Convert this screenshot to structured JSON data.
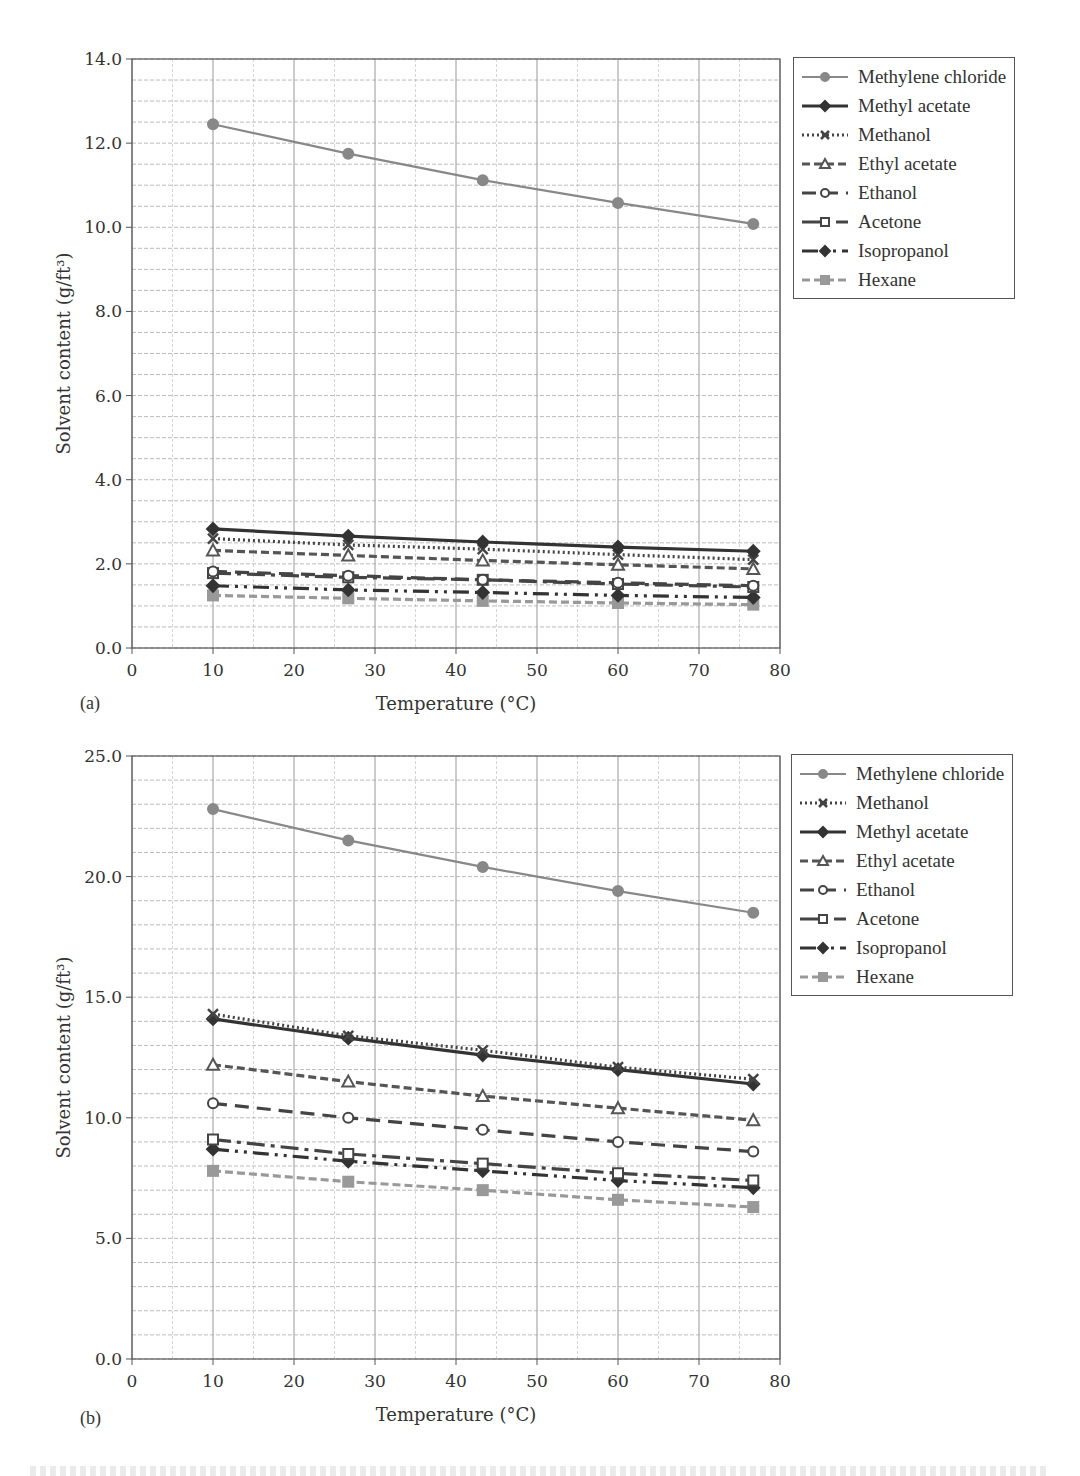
{
  "chart_data": [
    {
      "panel": "(a)",
      "type": "line",
      "title": "",
      "xlabel": "Temperature (°C)",
      "ylabel": "Solvent content (g/ft3)",
      "xlim": [
        0,
        80
      ],
      "ylim": [
        0,
        14
      ],
      "xticks": [
        0,
        10,
        20,
        30,
        40,
        50,
        60,
        70,
        80
      ],
      "yticks": [
        "0.0",
        "2.0",
        "4.0",
        "6.0",
        "8.0",
        "10.0",
        "12.0",
        "14.0"
      ],
      "grid": true,
      "legend_position": "right",
      "x": [
        10,
        26.7,
        43.3,
        60,
        76.7
      ],
      "series": [
        {
          "name": "Methylene chloride",
          "values": [
            12.45,
            11.75,
            11.12,
            10.58,
            10.08
          ],
          "style": "solid",
          "marker": "circle",
          "color": "#888888"
        },
        {
          "name": "Methyl acetate",
          "values": [
            2.83,
            2.66,
            2.52,
            2.4,
            2.3
          ],
          "style": "solid",
          "marker": "diamond",
          "color": "#333333"
        },
        {
          "name": "Methanol",
          "values": [
            2.6,
            2.45,
            2.35,
            2.22,
            2.1
          ],
          "style": "dotted",
          "marker": "x",
          "color": "#444444"
        },
        {
          "name": "Ethyl acetate",
          "values": [
            2.32,
            2.2,
            2.08,
            1.98,
            1.88
          ],
          "style": "dashed",
          "marker": "triangle",
          "color": "#555555"
        },
        {
          "name": "Ethanol",
          "values": [
            1.82,
            1.72,
            1.62,
            1.55,
            1.48
          ],
          "style": "longdash",
          "marker": "circle-open",
          "color": "#444444"
        },
        {
          "name": "Acetone",
          "values": [
            1.78,
            1.68,
            1.62,
            1.52,
            1.45
          ],
          "style": "dashdot",
          "marker": "square-open",
          "color": "#444444"
        },
        {
          "name": "Isopropanol",
          "values": [
            1.48,
            1.38,
            1.32,
            1.25,
            1.2
          ],
          "style": "dashdotdot",
          "marker": "diamond",
          "color": "#333333"
        },
        {
          "name": "Hexane",
          "values": [
            1.25,
            1.18,
            1.12,
            1.07,
            1.03
          ],
          "style": "dashed",
          "marker": "square",
          "color": "#999999"
        }
      ]
    },
    {
      "panel": "(b)",
      "type": "line",
      "title": "",
      "xlabel": "Temperature (°C)",
      "ylabel": "Solvent content (g/ft3)",
      "xlim": [
        0,
        80
      ],
      "ylim": [
        0,
        25
      ],
      "xticks": [
        0,
        10,
        20,
        30,
        40,
        50,
        60,
        70,
        80
      ],
      "yticks": [
        "0.0",
        "5.0",
        "10.0",
        "15.0",
        "20.0",
        "25.0"
      ],
      "grid": true,
      "legend_position": "right",
      "x": [
        10,
        26.7,
        43.3,
        60,
        76.7
      ],
      "series": [
        {
          "name": "Methylene chloride",
          "values": [
            22.8,
            21.5,
            20.4,
            19.4,
            18.5
          ],
          "style": "solid",
          "marker": "circle",
          "color": "#888888"
        },
        {
          "name": "Methanol",
          "values": [
            14.3,
            13.4,
            12.8,
            12.1,
            11.6
          ],
          "style": "dotted",
          "marker": "x",
          "color": "#444444"
        },
        {
          "name": "Methyl acetate",
          "values": [
            14.1,
            13.3,
            12.6,
            12.0,
            11.4
          ],
          "style": "solid",
          "marker": "diamond",
          "color": "#333333"
        },
        {
          "name": "Ethyl acetate",
          "values": [
            12.2,
            11.5,
            10.9,
            10.4,
            9.9
          ],
          "style": "dashed",
          "marker": "triangle",
          "color": "#555555"
        },
        {
          "name": "Ethanol",
          "values": [
            10.6,
            10.0,
            9.5,
            9.0,
            8.6
          ],
          "style": "longdash",
          "marker": "circle-open",
          "color": "#444444"
        },
        {
          "name": "Acetone",
          "values": [
            9.1,
            8.5,
            8.1,
            7.7,
            7.4
          ],
          "style": "dashdot",
          "marker": "square-open",
          "color": "#444444"
        },
        {
          "name": "Isopropanol",
          "values": [
            8.7,
            8.2,
            7.8,
            7.4,
            7.1
          ],
          "style": "dashdotdot",
          "marker": "diamond",
          "color": "#333333"
        },
        {
          "name": "Hexane",
          "values": [
            7.8,
            7.35,
            7.0,
            6.6,
            6.3
          ],
          "style": "dashed",
          "marker": "square",
          "color": "#999999"
        }
      ]
    }
  ],
  "panels": {
    "a": {
      "label": "(a)",
      "xlabel": "Temperature (°C)",
      "ylabel": "Solvent content (g/ft³)"
    },
    "b": {
      "label": "(b)",
      "xlabel": "Temperature (°C)",
      "ylabel": "Solvent content (g/ft³)"
    }
  }
}
